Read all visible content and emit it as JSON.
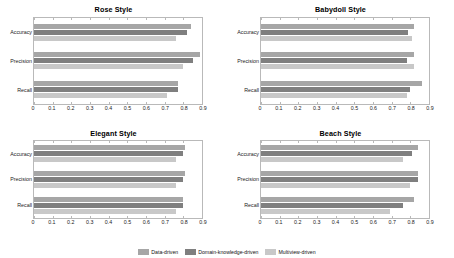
{
  "chart_data": {
    "type": "bar",
    "orientation": "horizontal",
    "title": "",
    "xlabel": "",
    "ylabel": "",
    "xlim": [
      0,
      0.9
    ],
    "xticks": [
      "0",
      "0.1",
      "0.2",
      "0.3",
      "0.4",
      "0.5",
      "0.6",
      "0.7",
      "0.8",
      "0.9"
    ],
    "xtick_values": [
      0,
      0.1,
      0.2,
      0.3,
      0.4,
      0.5,
      0.6,
      0.7,
      0.8,
      0.9
    ],
    "categories": [
      "Accuracy",
      "Precision",
      "Recall"
    ],
    "grid": false,
    "legend_position": "bottom-center",
    "series_names": [
      "Data-driven",
      "Domain-knowledge-driven",
      "Multiview-driven"
    ],
    "series_colors": [
      "#a6a6a6",
      "#7f7f7f",
      "#c8c8c8"
    ],
    "panels": [
      {
        "title": "Rose Style",
        "series": [
          {
            "name": "Data-driven",
            "values": [
              0.84,
              0.89,
              0.77
            ]
          },
          {
            "name": "Domain-knowledge-driven",
            "values": [
              0.82,
              0.85,
              0.77
            ]
          },
          {
            "name": "Multiview-driven",
            "values": [
              0.76,
              0.8,
              0.71
            ]
          }
        ]
      },
      {
        "title": "Babydoll Style",
        "series": [
          {
            "name": "Data-driven",
            "values": [
              0.82,
              0.82,
              0.86
            ]
          },
          {
            "name": "Domain-knowledge-driven",
            "values": [
              0.79,
              0.78,
              0.8
            ]
          },
          {
            "name": "Multiview-driven",
            "values": [
              0.81,
              0.82,
              0.78
            ]
          }
        ]
      },
      {
        "title": "Elegant Style",
        "series": [
          {
            "name": "Data-driven",
            "values": [
              0.81,
              0.81,
              0.8
            ]
          },
          {
            "name": "Domain-knowledge-driven",
            "values": [
              0.8,
              0.8,
              0.8
            ]
          },
          {
            "name": "Multiview-driven",
            "values": [
              0.76,
              0.76,
              0.76
            ]
          }
        ]
      },
      {
        "title": "Beach Style",
        "series": [
          {
            "name": "Data-driven",
            "values": [
              0.84,
              0.84,
              0.82
            ]
          },
          {
            "name": "Domain-knowledge-driven",
            "values": [
              0.81,
              0.84,
              0.76
            ]
          },
          {
            "name": "Multiview-driven",
            "values": [
              0.76,
              0.8,
              0.69
            ]
          }
        ]
      }
    ]
  }
}
